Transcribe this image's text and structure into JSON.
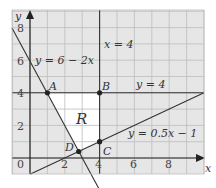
{
  "diagram": {
    "axes": {
      "x_label": "x",
      "y_label": "y",
      "origin_label": "0",
      "x_ticks": [
        "2",
        "4",
        "6",
        "8"
      ],
      "y_ticks": [
        "2",
        "4",
        "6",
        "8"
      ]
    },
    "lines": [
      {
        "equation": "y = 6 − 2x"
      },
      {
        "equation": "x = 4"
      },
      {
        "equation": "y = 4"
      },
      {
        "equation": "y = 0.5x − 1"
      }
    ],
    "points": [
      {
        "name": "A",
        "x": 1,
        "y": 4
      },
      {
        "name": "B",
        "x": 4,
        "y": 4
      },
      {
        "name": "C",
        "x": 4,
        "y": 1
      },
      {
        "name": "D",
        "x": 2.8,
        "y": 0.4
      }
    ],
    "region_label": "R",
    "colors": {
      "shade": "#e6e6e6",
      "grid": "#bdbdbd",
      "line": "#333333",
      "region": "#ffffff"
    }
  }
}
